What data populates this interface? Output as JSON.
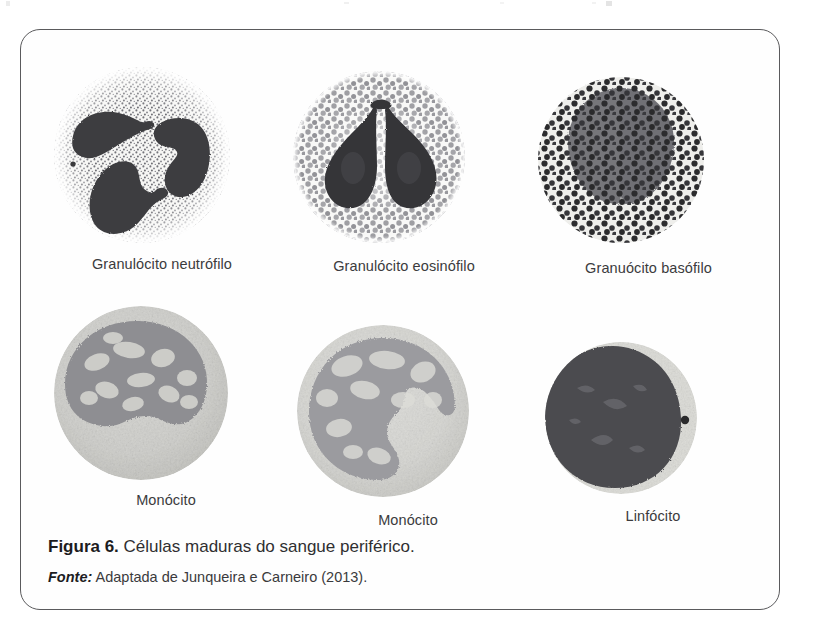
{
  "figure": {
    "caption": {
      "figure_number": "Figura 6.",
      "title": "Células maduras do sangue periférico.",
      "source_label": "Fonte:",
      "source_text": "Adaptada de Junqueira e Carneiro (2013)."
    },
    "cells": [
      {
        "id": "granulocito-neutrofilo",
        "label": "Granulócito neutrófilo",
        "nucleus": "multi-lobed dark nucleus, 3 lobes joined by thin filaments",
        "cytoplasm": "fine pale stippled granules",
        "granule_style": "fine-stipple",
        "granule_color": "#6e6e70",
        "nucleus_color": "#3a3a3c",
        "cytoplasm_color": "#f2f2f0"
      },
      {
        "id": "granulocito-eosinofilo",
        "label": "Granulócito eosinófilo",
        "nucleus": "bilobed dark nucleus, two pear-shaped lobes",
        "cytoplasm": "coarse rounded granules",
        "granule_style": "coarse-round",
        "granule_color": "#8a8a8c",
        "nucleus_color": "#35353a",
        "cytoplasm_color": "#f4f4f2"
      },
      {
        "id": "granulocito-basofilo",
        "label": "Granuócito basófilo",
        "nucleus": "bilobed grey nucleus filling most of the cell",
        "cytoplasm": "dense very dark coarse granules overlying nucleus",
        "granule_style": "dark-blotch",
        "granule_color": "#2c2c2e",
        "nucleus_color": "#76767a",
        "cytoplasm_color": "#e9e9e6"
      },
      {
        "id": "monocito-1",
        "label": "Monócito",
        "nucleus": "large kidney-shaped indented nucleus, upper portion",
        "cytoplasm": "pale grey finely granular cytoplasm",
        "granule_style": "smooth-pale",
        "granule_color": "#c9c9c6",
        "nucleus_color": "#8e8e90",
        "cytoplasm_color": "#dededb"
      },
      {
        "id": "monocito-2",
        "label": "Monócito",
        "nucleus": "horseshoe / C-shaped nucleus with central pale notch",
        "cytoplasm": "pale grey finely granular cytoplasm",
        "granule_style": "smooth-pale",
        "granule_color": "#cfcfcc",
        "nucleus_color": "#9a9a9c",
        "cytoplasm_color": "#e2e2df"
      },
      {
        "id": "linfocito",
        "label": "Linfócito",
        "nucleus": "large round very dark nucleus filling nearly the whole cell",
        "cytoplasm": "thin pale rim of cytoplasm with one small dark granule",
        "granule_style": "thin-rim",
        "granule_color": "#2a2a2c",
        "nucleus_color": "#4a4a4e",
        "cytoplasm_color": "#e6e6e3"
      }
    ]
  },
  "style": {
    "border_color": "#5a5a5c",
    "label_color": "#3b3b3d",
    "caption_color": "#2f2f31",
    "page_background": "#ffffff"
  }
}
